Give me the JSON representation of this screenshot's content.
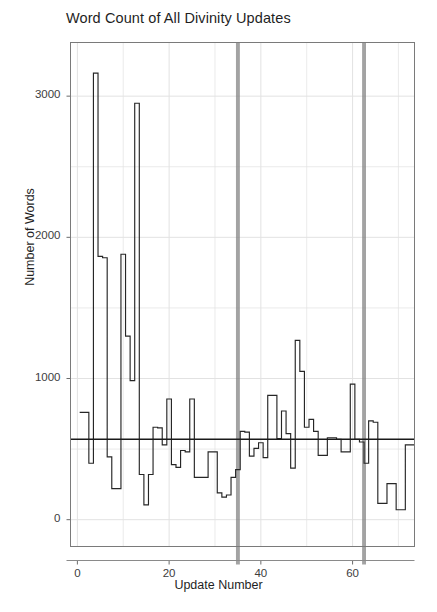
{
  "chart_data": {
    "type": "line",
    "subtype": "step-post",
    "title": "Word Count of All Divinity Updates",
    "xlabel": "Update Number",
    "ylabel": "Number of Words",
    "xlim": [
      -1.5,
      73.5
    ],
    "ylim": [
      -190,
      3380
    ],
    "xticks": [
      0,
      20,
      40,
      60
    ],
    "yticks": [
      0,
      1000,
      2000,
      3000
    ],
    "xtick_labels": [
      "0",
      "20",
      "40",
      "60"
    ],
    "ytick_labels": [
      "0",
      "1000",
      "2000",
      "3000"
    ],
    "grid": true,
    "grid_minor": true,
    "legend": "none",
    "x": [
      1,
      2,
      3,
      4,
      5,
      6,
      7,
      8,
      9,
      10,
      11,
      12,
      13,
      14,
      15,
      16,
      17,
      18,
      19,
      20,
      21,
      22,
      23,
      24,
      25,
      26,
      27,
      28,
      29,
      30,
      31,
      32,
      33,
      34,
      35,
      36,
      37,
      38,
      39,
      40,
      41,
      42,
      43,
      44,
      45,
      46,
      47,
      48,
      49,
      50,
      51,
      52,
      53,
      54,
      55,
      56,
      57,
      58,
      59,
      60,
      61,
      62,
      63,
      64,
      65,
      66,
      67,
      68,
      69,
      70,
      71,
      72,
      73
    ],
    "values": [
      760,
      760,
      400,
      3163,
      1865,
      1855,
      445,
      220,
      220,
      1880,
      1300,
      985,
      2950,
      320,
      105,
      320,
      655,
      650,
      530,
      855,
      390,
      370,
      490,
      480,
      855,
      300,
      300,
      300,
      480,
      480,
      190,
      160,
      175,
      300,
      355,
      625,
      620,
      450,
      505,
      545,
      440,
      880,
      880,
      575,
      770,
      610,
      365,
      1270,
      1050,
      655,
      710,
      625,
      455,
      455,
      580,
      580,
      570,
      480,
      480,
      960,
      570,
      550,
      400,
      700,
      690,
      115,
      115,
      255,
      255,
      70,
      70,
      530,
      530
    ],
    "reference_line": {
      "orientation": "horizontal",
      "value": 570,
      "color": "#1a1a1a",
      "width": 1.4
    },
    "vertical_bands": [
      {
        "x": 35.0,
        "label": "",
        "color": "#808080",
        "width_units": 0.85
      },
      {
        "x": 62.5,
        "label": "",
        "color": "#808080",
        "width_units": 0.85
      }
    ],
    "line_color": "#262626",
    "fill_color": "#ffffff",
    "panel_background": "#ffffff",
    "grid_color": "#e2e2e2",
    "border_color": "#7a7a7a"
  }
}
